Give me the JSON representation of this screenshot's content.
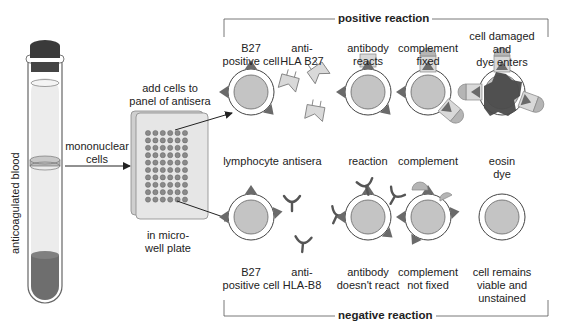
{
  "tube": {
    "label": "anticoagulated blood",
    "colors": {
      "cap": "#3a3a3a",
      "plasma": "#ececec",
      "layer": "#bdbdbd",
      "rbc": "#6e6e6e"
    }
  },
  "arrows": {
    "mononuclear_label": "mononuclear\ncells"
  },
  "plate": {
    "title": "add cells to\npanel of antisera",
    "caption": "in micro-\nwell plate",
    "rows": 10,
    "cols": 6
  },
  "positive": {
    "header": "positive reaction",
    "steps": [
      {
        "top": "B27\npositive cell",
        "bottom": "lymphocyte"
      },
      {
        "top": "anti-\nHLA B27",
        "bottom": "antisera"
      },
      {
        "top": "antibody\nreacts",
        "bottom": "reaction"
      },
      {
        "top": "complement\nfixed",
        "bottom": "complement"
      },
      {
        "top": "cell damaged\nand\ndye enters",
        "bottom": "eosin\ndye"
      }
    ]
  },
  "negative": {
    "header": "negative reaction",
    "steps": [
      {
        "top": "B27\npositive cell"
      },
      {
        "top": "anti-\nHLA-B8"
      },
      {
        "top": "antibody\ndoesn't react"
      },
      {
        "top": "complement\nnot fixed"
      },
      {
        "top": "cell remains\nviable and\nunstained"
      }
    ]
  },
  "colors": {
    "cell_nucleus": "#c4c4c4",
    "antigen": "#6a6a6a",
    "antibody_fill": "#d9d9d9",
    "antibody_dark": "#555555",
    "complement": "#b5b5b5",
    "dye": "#4a4a4a",
    "line": "#333333"
  }
}
